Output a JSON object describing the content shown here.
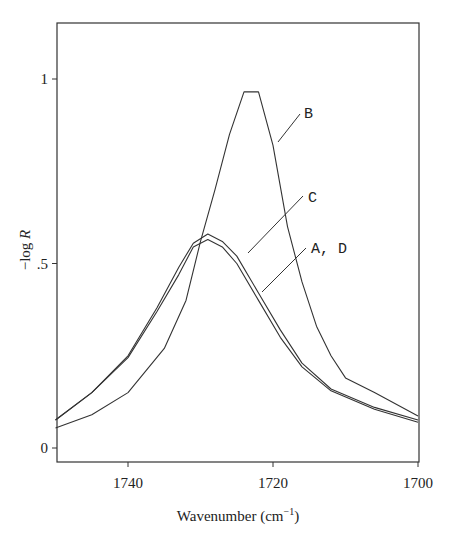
{
  "chart_data": {
    "type": "line",
    "title": "",
    "xlabel": "Wavenumber (cm⁻¹)",
    "ylabel": "−log R",
    "xlim": [
      1750,
      1700
    ],
    "ylim": [
      -0.04,
      1.15
    ],
    "x_reversed": true,
    "grid": false,
    "legend": "inline curve labels with leader lines",
    "xticks": [
      1740,
      1720,
      1700
    ],
    "xtick_labels": [
      "1740",
      "1720",
      "1700"
    ],
    "yticks": [
      0,
      0.5,
      1
    ],
    "ytick_labels": [
      "0",
      ".5",
      "1"
    ],
    "series": [
      {
        "name": "B",
        "x": [
          1750,
          1745,
          1740,
          1735,
          1732,
          1730,
          1728,
          1726,
          1724,
          1722,
          1720,
          1718,
          1716,
          1714,
          1712,
          1710,
          1706,
          1700
        ],
        "values": [
          0.054,
          0.09,
          0.15,
          0.27,
          0.4,
          0.56,
          0.7,
          0.85,
          0.965,
          0.965,
          0.82,
          0.6,
          0.45,
          0.33,
          0.25,
          0.19,
          0.15,
          0.087
        ]
      },
      {
        "name": "C",
        "x": [
          1750,
          1745,
          1740,
          1736,
          1733,
          1731,
          1729,
          1727,
          1725,
          1722,
          1719,
          1716,
          1712,
          1706,
          1700
        ],
        "values": [
          0.076,
          0.15,
          0.25,
          0.38,
          0.49,
          0.555,
          0.58,
          0.56,
          0.52,
          0.42,
          0.32,
          0.23,
          0.16,
          0.11,
          0.076
        ]
      },
      {
        "name": "A, D",
        "x": [
          1750,
          1745,
          1740,
          1736,
          1733,
          1731,
          1729,
          1727,
          1725,
          1722,
          1719,
          1716,
          1712,
          1706,
          1700
        ],
        "values": [
          0.076,
          0.15,
          0.245,
          0.37,
          0.47,
          0.545,
          0.565,
          0.545,
          0.5,
          0.4,
          0.3,
          0.22,
          0.155,
          0.105,
          0.07
        ]
      }
    ],
    "annotations": [
      {
        "text": "B",
        "label_x": 304,
        "label_y": 118,
        "line_from": [
          278,
          142
        ],
        "line_to": [
          300,
          114
        ]
      },
      {
        "text": "C",
        "label_x": 308,
        "label_y": 202,
        "line_from": [
          248,
          253
        ],
        "line_to": [
          303,
          196
        ]
      },
      {
        "text": "A, D",
        "label_x": 311,
        "label_y": 253,
        "line_from": [
          262,
          292
        ],
        "line_to": [
          306,
          248
        ]
      }
    ]
  },
  "layout": {
    "frame": {
      "left": 57,
      "right": 419,
      "top": 23,
      "bottom": 462
    },
    "x_px_per_unit": 7.25,
    "x_ref_value": 1740,
    "x_ref_px": 128,
    "y_px_per_unit": 369,
    "y_zero_px": 448,
    "line_color": "#333333"
  }
}
